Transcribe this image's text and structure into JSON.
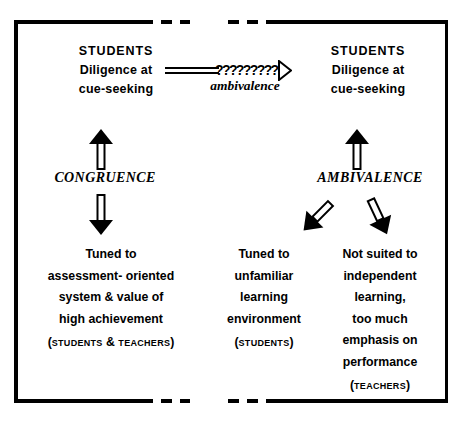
{
  "diagram": {
    "top_row": {
      "left": {
        "title": "STUDENTS",
        "line2": "Diligence at",
        "line3": "cue-seeking"
      },
      "right": {
        "title": "STUDENTS",
        "line2": "Diligence at",
        "line3": "cue-seeking"
      },
      "connector": {
        "question_marks": "??????????",
        "label": "ambivalence"
      }
    },
    "relations": {
      "left_label": "CONGRUENCE",
      "right_label": "AMBIVALENCE"
    },
    "outcomes": {
      "left": {
        "lines": [
          "Tuned to",
          "assessment- oriented",
          "system & value of",
          "high achievement"
        ],
        "actors_prefix": "(",
        "actors_a": "Students",
        "actors_join": " & ",
        "actors_b": "Teachers",
        "actors_suffix": ")"
      },
      "middle": {
        "lines": [
          "Tuned to",
          "unfamiliar",
          "learning",
          "environment"
        ],
        "actors_prefix": "(",
        "actors_a": "Students",
        "actors_suffix": ")"
      },
      "right": {
        "lines": [
          "Not suited to",
          "independent",
          "learning,",
          "too much",
          "emphasis on",
          "performance"
        ],
        "actors_prefix": "(",
        "actors_a": "Teachers",
        "actors_suffix": ")"
      }
    },
    "colors": {
      "ink": "#000000",
      "page": "#ffffff"
    }
  }
}
